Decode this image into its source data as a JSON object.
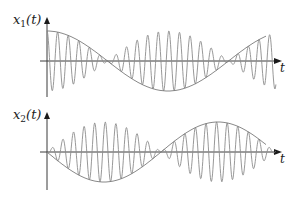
{
  "figure": {
    "plots": [
      {
        "id": "x1",
        "ylabel_main": "x",
        "ylabel_sub": "1",
        "ylabel_arg": "(t)",
        "xlabel": "t",
        "origin": {
          "x": 47,
          "y": 61
        },
        "yaxis": {
          "top": 17,
          "bottom": 97
        },
        "xaxis": {
          "left": 40,
          "right": 282
        },
        "envelope": {
          "type": "cos",
          "amplitude_px": 30,
          "period_px": 242,
          "phase_deg": 0,
          "x_end": 266
        },
        "carrier": {
          "period_px": 10.6,
          "x_end": 276
        },
        "label_pos": {
          "x": 13,
          "y": 24
        },
        "t_label_pos": {
          "x": 280,
          "y": 72
        }
      },
      {
        "id": "x2",
        "ylabel_main": "x",
        "ylabel_sub": "2",
        "ylabel_arg": "(t)",
        "xlabel": "t",
        "origin": {
          "x": 47,
          "y": 152
        },
        "yaxis": {
          "top": 112,
          "bottom": 190
        },
        "xaxis": {
          "left": 40,
          "right": 282
        },
        "envelope": {
          "type": "neg-sin",
          "amplitude_px": 30,
          "period_px": 228,
          "phase_deg": 0,
          "x_end": 266
        },
        "carrier": {
          "period_px": 10.6,
          "x_end": 276
        },
        "label_pos": {
          "x": 13,
          "y": 119
        },
        "t_label_pos": {
          "x": 280,
          "y": 163
        }
      }
    ],
    "colors": {
      "axis": "#3a3a3a",
      "envelope": "#7a7a7a",
      "carrier": "#8c8c8c"
    }
  }
}
